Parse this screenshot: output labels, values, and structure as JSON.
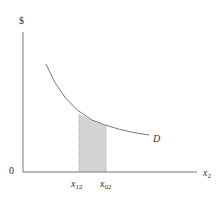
{
  "diagram": {
    "y_axis_label": "$",
    "origin_label": "0",
    "x_axis_label": {
      "base": "x",
      "sub": "2"
    },
    "curve_label": "D",
    "ticks": [
      {
        "base": "x",
        "sub": "12"
      },
      {
        "base": "x",
        "sub": "02"
      }
    ],
    "colors": {
      "axis": "#777777",
      "curve": "#7a7a7a",
      "shade": "#d4d4d4",
      "shade_edge": "#999999"
    }
  }
}
